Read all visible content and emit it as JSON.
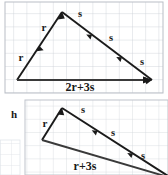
{
  "figure": {
    "type": "vector-diagram",
    "background": "#ffffff",
    "grid_color": "#c9cdd4",
    "ink_color": "#1a1a1a",
    "panels": [
      {
        "id": "top",
        "label": "",
        "grid": {
          "x": 5,
          "y": 2,
          "width": 158,
          "height": 91,
          "cell": 13.2
        },
        "resultant_label": "2r+3s",
        "vertices": {
          "left": [
            17,
            80
          ],
          "apex": [
            62,
            12
          ],
          "right": [
            152,
            80
          ]
        },
        "segments": [
          {
            "name": "r",
            "count": 2,
            "label": "r"
          },
          {
            "name": "s",
            "count": 3,
            "label": "s"
          }
        ],
        "r_labels": [
          {
            "text": "r",
            "x": 21,
            "y": 61
          },
          {
            "text": "r",
            "x": 44,
            "y": 31
          }
        ],
        "s_labels": [
          {
            "text": "s",
            "x": 80,
            "y": 17
          },
          {
            "text": "s",
            "x": 111,
            "y": 41
          },
          {
            "text": "s",
            "x": 142,
            "y": 65
          }
        ],
        "base_label": {
          "text": "2r+3s",
          "x": 80,
          "y": 90
        }
      },
      {
        "id": "bottom",
        "label": "h",
        "label_pos": {
          "x": 14,
          "y": 117
        },
        "grid": {
          "x": 25,
          "y": 100,
          "width": 143,
          "height": 75,
          "cell": 13.2
        },
        "resultant_label": "r+3s",
        "vertices": {
          "left": [
            42,
            140
          ],
          "apex": [
            62,
            108
          ],
          "right": [
            168,
            175
          ]
        },
        "segments": [
          {
            "name": "r",
            "count": 1,
            "label": "r"
          },
          {
            "name": "s",
            "count": 3,
            "label": "s"
          }
        ],
        "r_labels": [
          {
            "text": "r",
            "x": 45,
            "y": 126
          }
        ],
        "s_labels": [
          {
            "text": "s",
            "x": 83,
            "y": 113
          },
          {
            "text": "s",
            "x": 113,
            "y": 136
          },
          {
            "text": "s",
            "x": 143,
            "y": 159
          }
        ],
        "base_label": {
          "text": "r+3s",
          "x": 85,
          "y": 169
        }
      }
    ],
    "corner_grid": {
      "x": 0,
      "y": 140,
      "width": 20,
      "height": 35
    }
  }
}
